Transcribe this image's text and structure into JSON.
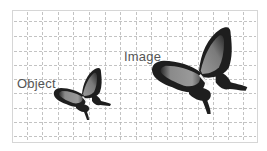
{
  "diagram": {
    "type": "magnification illustration",
    "labels": {
      "object": "Object",
      "image": "Image"
    },
    "grid": {
      "style": "dashed",
      "color": "#b4b4b4",
      "vertical_lines_x": [
        27,
        42,
        58,
        73,
        89,
        105,
        120,
        136,
        151,
        167,
        182,
        198,
        213,
        228,
        243
      ],
      "horizontal_lines_y": [
        21,
        36,
        51,
        65,
        79,
        93,
        108,
        122,
        136
      ]
    },
    "frame": {
      "border_color": "#d6d6d6"
    },
    "figures": [
      {
        "name": "object-butterfly",
        "description": "small butterfly",
        "scale": 1
      },
      {
        "name": "image-butterfly",
        "description": "enlarged butterfly",
        "scale": 2
      }
    ],
    "colors": {
      "text": "#555555",
      "wing_dark": "#1e1e1e",
      "wing_mid": "#7a7a7a",
      "wing_light": "#a0a0a0"
    }
  }
}
